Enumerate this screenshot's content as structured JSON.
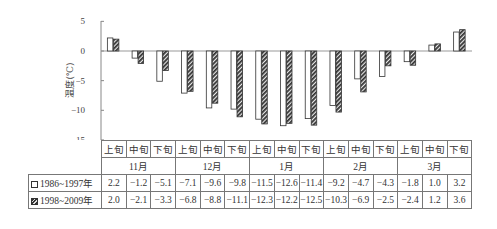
{
  "chart_data": {
    "type": "bar",
    "title": "",
    "xlabel": "",
    "ylabel": "温度(℃)",
    "ylim": [
      -15,
      5
    ],
    "yticks": [
      5,
      0,
      -5,
      -10,
      -15
    ],
    "grid": false,
    "legend_position": "table-left",
    "categories": [
      "上旬",
      "中旬",
      "下旬",
      "上旬",
      "中旬",
      "下旬",
      "上旬",
      "中旬",
      "下旬",
      "上旬",
      "中旬",
      "下旬",
      "上旬",
      "中旬",
      "下旬"
    ],
    "month_groups": [
      {
        "label": "11月",
        "span": 3
      },
      {
        "label": "12月",
        "span": 3
      },
      {
        "label": "1月",
        "span": 3
      },
      {
        "label": "2月",
        "span": 3
      },
      {
        "label": "3月",
        "span": 3
      }
    ],
    "series": [
      {
        "name": "1986~1997年",
        "style": "white",
        "values": [
          2.2,
          -1.2,
          -5.1,
          -7.1,
          -9.6,
          -9.8,
          -11.5,
          -12.6,
          -11.4,
          -9.2,
          -4.7,
          -4.3,
          -1.8,
          1.0,
          3.2
        ],
        "labels": [
          "2.2",
          "−1.2",
          "−5.1",
          "−7.1",
          "−9.6",
          "−9.8",
          "−11.5",
          "−12.6",
          "−11.4",
          "−9.2",
          "−4.7",
          "−4.3",
          "−1.8",
          "1.0",
          "3.2"
        ]
      },
      {
        "name": "1998~2009年",
        "style": "hatched",
        "values": [
          2.0,
          -2.1,
          -3.3,
          -6.8,
          -8.8,
          -11.1,
          -12.3,
          -12.2,
          -12.5,
          -10.3,
          -6.9,
          -2.5,
          -2.4,
          1.2,
          3.6
        ],
        "labels": [
          "2.0",
          "−2.1",
          "−3.3",
          "−6.8",
          "−8.8",
          "−11.1",
          "−12.3",
          "−12.2",
          "−12.5",
          "−10.3",
          "−6.9",
          "−2.5",
          "−2.4",
          "1.2",
          "3.6"
        ]
      }
    ]
  },
  "axis": {
    "ylabel": "温度(℃)",
    "ticks": [
      "5",
      "0",
      "−5",
      "−10",
      "−15"
    ]
  },
  "colors": {
    "hatch_dark": "#333333",
    "axis": "#888888"
  }
}
